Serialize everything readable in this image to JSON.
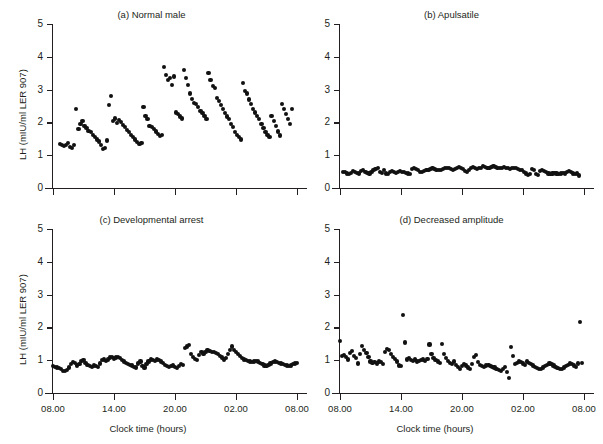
{
  "figure": {
    "axis_color": "#231f20",
    "dot_color": "#111111",
    "xlabel": "Clock time (hours)",
    "ylabel": "LH (mIU/ml LER 907)",
    "ytick_labels": [
      "0",
      "1",
      "2",
      "3",
      "4",
      "5"
    ],
    "xtick_labels": [
      "08.00",
      "14.00",
      "20.00",
      "02.00",
      "08.00"
    ]
  },
  "chart_data": [
    {
      "type": "scatter",
      "panel": "a",
      "title": "(a) Normal male",
      "xlabel": "Clock time (hours)",
      "ylabel": "LH (mIU/ml LER 907)",
      "xlim": [
        8,
        32
      ],
      "ylim": [
        0,
        5
      ],
      "xticks": [
        8,
        14,
        20,
        26,
        32
      ],
      "xtick_labels": [
        "08.00",
        "14.00",
        "20.00",
        "02.00",
        "08.00"
      ],
      "yticks": [
        0,
        1,
        2,
        3,
        4,
        5
      ],
      "grid": false,
      "legend": "none",
      "x": [
        8.7,
        8.9,
        9.1,
        9.3,
        9.5,
        9.7,
        9.9,
        10.1,
        10.3,
        10.5,
        10.7,
        10.9,
        11.1,
        11.3,
        11.5,
        11.7,
        11.9,
        12.1,
        12.3,
        12.5,
        12.7,
        12.9,
        13.1,
        13.3,
        13.5,
        13.7,
        13.9,
        14.1,
        14.3,
        14.5,
        14.7,
        14.9,
        15.1,
        15.3,
        15.5,
        15.7,
        15.9,
        16.1,
        16.3,
        16.5,
        16.7,
        16.9,
        17.1,
        17.3,
        17.5,
        17.7,
        17.9,
        18.1,
        18.3,
        18.5,
        18.7,
        18.9,
        19.1,
        19.3,
        19.5,
        19.7,
        19.9,
        20.1,
        20.3,
        20.5,
        20.7,
        20.9,
        21.1,
        21.3,
        21.5,
        21.7,
        21.9,
        22.1,
        22.3,
        22.5,
        22.7,
        22.9,
        23.1,
        23.3,
        23.5,
        23.7,
        23.9,
        24.1,
        24.3,
        24.5,
        24.7,
        24.9,
        25.1,
        25.3,
        25.5,
        25.7,
        25.9,
        26.1,
        26.3,
        26.5,
        26.7,
        26.9,
        27.1,
        27.3,
        27.5,
        27.7,
        27.9,
        28.1,
        28.3,
        28.5,
        28.7,
        28.9,
        29.1,
        29.3,
        29.5,
        29.7,
        29.9,
        30.1,
        30.3,
        30.5,
        30.7,
        30.9,
        31.1,
        31.3,
        31.5
      ],
      "y": [
        1.35,
        1.3,
        1.28,
        1.32,
        1.38,
        1.26,
        1.22,
        1.3,
        2.4,
        1.8,
        1.95,
        2.05,
        1.9,
        1.82,
        1.75,
        1.7,
        1.62,
        1.55,
        1.48,
        1.42,
        1.3,
        1.18,
        1.22,
        1.45,
        2.52,
        2.8,
        2.05,
        2.12,
        1.98,
        2.08,
        2.0,
        1.92,
        1.85,
        1.78,
        1.7,
        1.62,
        1.55,
        1.48,
        1.4,
        1.35,
        1.38,
        2.48,
        2.2,
        2.1,
        1.9,
        1.85,
        1.8,
        1.72,
        1.65,
        1.58,
        1.62,
        3.7,
        3.45,
        3.3,
        3.35,
        3.15,
        3.4,
        2.3,
        2.25,
        2.18,
        2.12,
        3.6,
        3.35,
        3.15,
        2.88,
        2.72,
        2.6,
        2.55,
        2.48,
        2.35,
        2.28,
        2.2,
        2.1,
        3.5,
        3.3,
        3.1,
        3.05,
        2.75,
        2.65,
        2.52,
        2.4,
        2.28,
        2.18,
        2.1,
        1.95,
        1.85,
        1.7,
        1.62,
        1.55,
        1.48,
        3.2,
        2.95,
        2.88,
        2.7,
        2.55,
        2.42,
        2.3,
        2.2,
        2.1,
        1.95,
        1.82,
        1.7,
        1.62,
        1.55,
        2.2,
        2.05,
        1.9,
        1.72,
        1.6,
        2.55,
        2.4,
        2.25,
        2.1,
        1.95,
        2.42
      ]
    },
    {
      "type": "scatter",
      "panel": "b",
      "title": "(b) Apulsatile",
      "xlabel": "Clock time (hours)",
      "ylabel": "LH (mIU/ml LER 907)",
      "xlim": [
        8,
        32
      ],
      "ylim": [
        0,
        5
      ],
      "xticks": [
        8,
        14,
        20,
        26,
        32
      ],
      "xtick_labels": [
        "08.00",
        "14.00",
        "20.00",
        "02.00",
        "08.00"
      ],
      "yticks": [
        0,
        1,
        2,
        3,
        4,
        5
      ],
      "grid": false,
      "legend": "none",
      "x": [
        8.3,
        8.5,
        8.7,
        8.9,
        9.1,
        9.3,
        9.5,
        9.7,
        9.9,
        10.1,
        10.3,
        10.5,
        10.7,
        10.9,
        11.1,
        11.3,
        11.5,
        11.7,
        11.9,
        12.1,
        12.3,
        12.5,
        12.7,
        12.9,
        13.1,
        13.3,
        13.5,
        13.7,
        13.9,
        14.1,
        14.3,
        14.5,
        14.7,
        14.9,
        15.1,
        15.3,
        15.5,
        15.7,
        15.9,
        16.1,
        16.3,
        16.5,
        16.7,
        16.9,
        17.1,
        17.3,
        17.5,
        17.7,
        17.9,
        18.1,
        18.3,
        18.5,
        18.7,
        18.9,
        19.1,
        19.3,
        19.5,
        19.7,
        19.9,
        20.1,
        20.3,
        20.5,
        20.7,
        20.9,
        21.1,
        21.3,
        21.5,
        21.7,
        21.9,
        22.1,
        22.3,
        22.5,
        22.7,
        22.9,
        23.1,
        23.3,
        23.5,
        23.7,
        23.9,
        24.1,
        24.3,
        24.5,
        24.7,
        24.9,
        25.1,
        25.3,
        25.5,
        25.7,
        25.9,
        26.1,
        26.3,
        26.5,
        26.7,
        26.9,
        27.1,
        27.3,
        27.5,
        27.7,
        27.9,
        28.1,
        28.3,
        28.5,
        28.7,
        28.9,
        29.1,
        29.3,
        29.5,
        29.7,
        29.9,
        30.1,
        30.3,
        30.5,
        30.7,
        30.9,
        31.1,
        31.3,
        31.5
      ],
      "y": [
        0.5,
        0.48,
        0.44,
        0.42,
        0.46,
        0.52,
        0.5,
        0.46,
        0.44,
        0.52,
        0.55,
        0.5,
        0.46,
        0.44,
        0.48,
        0.54,
        0.58,
        0.62,
        0.5,
        0.46,
        0.56,
        0.44,
        0.42,
        0.48,
        0.52,
        0.5,
        0.46,
        0.48,
        0.52,
        0.5,
        0.48,
        0.46,
        0.44,
        0.42,
        0.58,
        0.6,
        0.58,
        0.56,
        0.48,
        0.5,
        0.52,
        0.54,
        0.56,
        0.58,
        0.6,
        0.58,
        0.56,
        0.54,
        0.56,
        0.58,
        0.6,
        0.62,
        0.6,
        0.58,
        0.56,
        0.58,
        0.62,
        0.64,
        0.62,
        0.58,
        0.52,
        0.5,
        0.56,
        0.6,
        0.64,
        0.62,
        0.58,
        0.6,
        0.62,
        0.66,
        0.64,
        0.62,
        0.6,
        0.64,
        0.66,
        0.64,
        0.62,
        0.6,
        0.62,
        0.64,
        0.62,
        0.6,
        0.58,
        0.6,
        0.62,
        0.6,
        0.58,
        0.56,
        0.54,
        0.5,
        0.44,
        0.4,
        0.42,
        0.58,
        0.56,
        0.42,
        0.4,
        0.52,
        0.54,
        0.52,
        0.5,
        0.44,
        0.42,
        0.44,
        0.46,
        0.44,
        0.42,
        0.44,
        0.46,
        0.44,
        0.5,
        0.52,
        0.48,
        0.44,
        0.42,
        0.44,
        0.38
      ]
    },
    {
      "type": "scatter",
      "panel": "c",
      "title": "(c) Developmental arrest",
      "xlabel": "Clock time (hours)",
      "ylabel": "LH (mIU/ml LER 907)",
      "xlim": [
        8,
        32
      ],
      "ylim": [
        0,
        5
      ],
      "xticks": [
        8,
        14,
        20,
        26,
        32
      ],
      "xtick_labels": [
        "08.00",
        "14.00",
        "20.00",
        "02.00",
        "08.00"
      ],
      "yticks": [
        0,
        1,
        2,
        3,
        4,
        5
      ],
      "grid": false,
      "legend": "none",
      "x": [
        8.0,
        8.2,
        8.4,
        8.6,
        8.8,
        9.0,
        9.2,
        9.4,
        9.6,
        9.8,
        10.0,
        10.2,
        10.4,
        10.6,
        10.8,
        11.0,
        11.2,
        11.4,
        11.6,
        11.8,
        12.0,
        12.2,
        12.4,
        12.6,
        12.8,
        13.0,
        13.2,
        13.4,
        13.6,
        13.8,
        14.0,
        14.2,
        14.4,
        14.6,
        14.8,
        15.0,
        15.2,
        15.4,
        15.6,
        15.8,
        16.0,
        16.2,
        16.4,
        16.6,
        16.8,
        17.0,
        17.2,
        17.4,
        17.6,
        17.8,
        18.0,
        18.2,
        18.4,
        18.6,
        18.8,
        19.0,
        19.2,
        19.4,
        19.6,
        19.8,
        20.0,
        20.2,
        20.4,
        20.6,
        20.8,
        21.0,
        21.2,
        21.4,
        21.6,
        21.8,
        22.0,
        22.2,
        22.4,
        22.6,
        22.8,
        23.0,
        23.2,
        23.4,
        23.6,
        23.8,
        24.0,
        24.2,
        24.4,
        24.6,
        24.8,
        25.0,
        25.2,
        25.4,
        25.6,
        25.8,
        26.0,
        26.2,
        26.4,
        26.6,
        26.8,
        27.0,
        27.2,
        27.4,
        27.6,
        27.8,
        28.0,
        28.2,
        28.4,
        28.6,
        28.8,
        29.0,
        29.2,
        29.4,
        29.6,
        29.8,
        30.0,
        30.2,
        30.4,
        30.6,
        30.8,
        31.0,
        31.2,
        31.4,
        31.6,
        31.8,
        32.0
      ],
      "y": [
        0.82,
        0.8,
        0.78,
        0.76,
        0.72,
        0.68,
        0.66,
        0.7,
        0.78,
        0.88,
        0.95,
        0.92,
        0.84,
        0.88,
        0.98,
        1.0,
        0.92,
        0.86,
        0.82,
        0.8,
        0.84,
        0.82,
        0.8,
        0.9,
        1.0,
        1.02,
        0.98,
        1.02,
        1.08,
        1.1,
        1.05,
        1.08,
        1.1,
        1.06,
        1.0,
        0.96,
        0.92,
        0.88,
        0.86,
        0.84,
        0.8,
        0.78,
        0.9,
        0.96,
        0.82,
        0.78,
        0.88,
        0.96,
        1.02,
        1.0,
        0.98,
        1.02,
        1.0,
        0.96,
        0.92,
        0.86,
        0.82,
        0.8,
        0.82,
        0.84,
        0.8,
        0.76,
        0.82,
        0.88,
        0.86,
        1.36,
        1.42,
        1.46,
        1.18,
        1.1,
        1.04,
        1.0,
        1.16,
        1.24,
        1.2,
        1.26,
        1.3,
        1.28,
        1.26,
        1.24,
        1.22,
        1.2,
        1.14,
        1.08,
        1.02,
        1.06,
        1.2,
        1.32,
        1.42,
        1.3,
        1.24,
        1.18,
        1.12,
        1.06,
        1.02,
        1.0,
        0.98,
        0.96,
        0.94,
        0.96,
        0.98,
        0.96,
        0.92,
        0.88,
        0.84,
        0.82,
        0.86,
        0.9,
        0.94,
        0.96,
        0.94,
        0.92,
        0.9,
        0.88,
        0.86,
        0.84,
        0.82,
        0.84,
        0.88,
        0.9,
        0.92
      ]
    },
    {
      "type": "scatter",
      "panel": "d",
      "title": "(d) Decreased amplitude",
      "xlabel": "Clock time (hours)",
      "ylabel": "LH (mIU/ml LER 907)",
      "xlim": [
        8,
        32
      ],
      "ylim": [
        0,
        5
      ],
      "xticks": [
        8,
        14,
        20,
        26,
        32
      ],
      "xtick_labels": [
        "08.00",
        "14.00",
        "20.00",
        "02.00",
        "08.00"
      ],
      "yticks": [
        0,
        1,
        2,
        3,
        4,
        5
      ],
      "grid": false,
      "legend": "none",
      "x": [
        8.0,
        8.2,
        8.4,
        8.6,
        8.8,
        9.0,
        9.2,
        9.4,
        9.6,
        9.8,
        10.0,
        10.2,
        10.4,
        10.6,
        10.8,
        11.0,
        11.2,
        11.4,
        11.6,
        11.8,
        12.0,
        12.2,
        12.4,
        12.6,
        12.8,
        13.0,
        13.2,
        13.4,
        13.6,
        13.8,
        14.0,
        14.2,
        14.4,
        14.6,
        14.8,
        15.0,
        15.2,
        15.4,
        15.6,
        15.8,
        16.0,
        16.2,
        16.4,
        16.6,
        16.8,
        17.0,
        17.2,
        17.4,
        17.6,
        17.8,
        18.0,
        18.2,
        18.4,
        18.6,
        18.8,
        19.0,
        19.2,
        19.4,
        19.6,
        19.8,
        20.0,
        20.2,
        20.4,
        20.6,
        20.8,
        21.0,
        21.2,
        21.4,
        21.6,
        21.8,
        22.0,
        22.2,
        22.4,
        22.6,
        22.8,
        23.0,
        23.2,
        23.4,
        23.6,
        23.8,
        24.0,
        24.2,
        24.4,
        24.6,
        24.8,
        25.0,
        25.2,
        25.4,
        25.6,
        25.8,
        26.0,
        26.2,
        26.4,
        26.6,
        26.8,
        27.0,
        27.2,
        27.4,
        27.6,
        27.8,
        28.0,
        28.2,
        28.4,
        28.6,
        28.8,
        29.0,
        29.2,
        29.4,
        29.6,
        29.8,
        30.0,
        30.2,
        30.4,
        30.6,
        30.8,
        31.0,
        31.2,
        31.4,
        31.6,
        31.8
      ],
      "y": [
        1.58,
        1.12,
        1.16,
        1.1,
        1.02,
        1.22,
        1.28,
        1.14,
        1.06,
        0.9,
        1.2,
        1.44,
        1.3,
        1.22,
        1.1,
        0.96,
        0.92,
        0.94,
        0.9,
        0.96,
        0.94,
        0.88,
        1.26,
        1.34,
        1.3,
        1.18,
        1.1,
        1.04,
        0.96,
        0.84,
        0.82,
        2.38,
        1.54,
        1.02,
        1.06,
        1.0,
        0.98,
        1.02,
        0.96,
        0.98,
        1.0,
        1.02,
        0.98,
        1.04,
        1.48,
        1.18,
        1.06,
        1.0,
        0.96,
        0.92,
        1.5,
        1.2,
        1.06,
        0.98,
        0.92,
        0.88,
        0.96,
        0.86,
        0.8,
        0.74,
        0.82,
        0.88,
        0.84,
        0.78,
        0.72,
        0.88,
        1.1,
        1.16,
        0.94,
        0.86,
        0.82,
        0.8,
        0.84,
        0.86,
        0.82,
        0.8,
        0.78,
        0.74,
        0.7,
        0.66,
        0.72,
        0.8,
        0.64,
        0.46,
        1.4,
        1.14,
        0.88,
        0.92,
        0.96,
        0.94,
        0.9,
        0.86,
        0.96,
        0.92,
        0.88,
        0.84,
        0.8,
        0.76,
        0.72,
        0.74,
        0.78,
        0.82,
        0.86,
        0.9,
        0.88,
        0.84,
        0.8,
        0.76,
        0.72,
        0.74,
        0.78,
        0.82,
        0.86,
        0.9,
        0.88,
        0.84,
        0.8,
        0.9,
        2.16,
        0.92
      ]
    }
  ]
}
